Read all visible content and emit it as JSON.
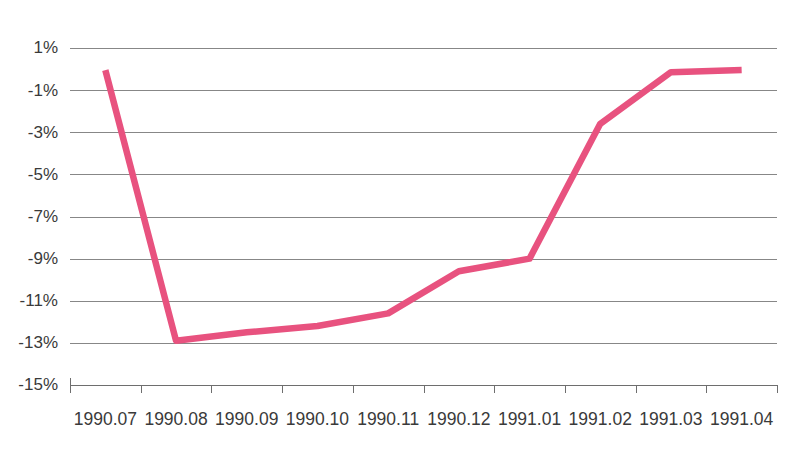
{
  "chart_data": {
    "type": "line",
    "title": "",
    "xlabel": "",
    "ylabel": "",
    "categories": [
      "1990.07",
      "1990.08",
      "1990.09",
      "1990.10",
      "1990.11",
      "1990.12",
      "1991.01",
      "1991.02",
      "1991.03",
      "1991.04"
    ],
    "series": [
      {
        "name": "series-1",
        "color": "#E8527F",
        "values": [
          -0.05,
          -12.9,
          -12.5,
          -12.2,
          -11.6,
          -9.6,
          -9.0,
          -2.6,
          -0.15,
          -0.05
        ]
      }
    ],
    "ylim": [
      -15,
      1
    ],
    "ytick_values": [
      1,
      -1,
      -3,
      -5,
      -7,
      -9,
      -11,
      -13,
      -15
    ],
    "ytick_labels": [
      "1%",
      "-1%",
      "-3%",
      "-5%",
      "-7%",
      "-9%",
      "-11%",
      "-13%",
      "-15%"
    ],
    "grid": true,
    "grid_axis": "y",
    "legend": false,
    "legend_position": "none",
    "units": "percent"
  },
  "axes": {
    "y_axis_name": "y-axis",
    "x_axis_name": "x-axis"
  },
  "colors": {
    "line": "#E8527F",
    "grid": "#7a7a7a",
    "axis": "#6e6e6e",
    "text": "#3a3a3a",
    "background": "#ffffff"
  }
}
